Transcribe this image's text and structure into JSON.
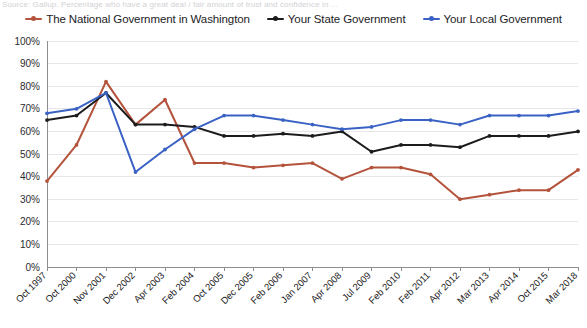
{
  "source_line": "Source: Gallup. Percentage who have a great deal / fair amount of trust and confidence in ...",
  "legend": [
    {
      "label": "The National Government in Washington",
      "color": "#b4533c",
      "name": "legend-item-national"
    },
    {
      "label": "Your State Government",
      "color": "#1c1c1e",
      "name": "legend-item-state"
    },
    {
      "label": "Your Local Government",
      "color": "#3a62c4",
      "name": "legend-item-local"
    }
  ],
  "chart_data": {
    "type": "line",
    "title": "",
    "xlabel": "",
    "ylabel": "",
    "ylim": [
      0,
      100
    ],
    "ytick_step": 10,
    "ytick_labels": [
      "100%",
      "90%",
      "80%",
      "70%",
      "60%",
      "50%",
      "40%",
      "30%",
      "20%",
      "10%",
      "0%"
    ],
    "grid": true,
    "legend_position": "top-center",
    "categories": [
      "Oct 1997",
      "Oct 2000",
      "Nov 2001",
      "Dec 2002",
      "Apr 2003",
      "Feb 2004",
      "Oct 2005",
      "Dec 2005",
      "Feb 2006",
      "Jan 2007",
      "Apr 2008",
      "Jul 2009",
      "Feb 2010",
      "Feb 2011",
      "Apr 2012",
      "Mar 2013",
      "Apr 2014",
      "Oct 2015",
      "Mar 2018"
    ],
    "series": [
      {
        "name": "The National Government in Washington",
        "color": "#b4533c",
        "values": [
          38,
          54,
          82,
          63,
          74,
          46,
          46,
          44,
          45,
          46,
          39,
          44,
          44,
          41,
          30,
          32,
          34,
          34,
          43
        ]
      },
      {
        "name": "Your State Government",
        "color": "#1c1c1e",
        "values": [
          65,
          67,
          77,
          63,
          63,
          62,
          58,
          58,
          59,
          58,
          60,
          51,
          54,
          54,
          53,
          58,
          58,
          58,
          60
        ]
      },
      {
        "name": "Your Local Government",
        "color": "#3a62c4",
        "values": [
          68,
          70,
          77,
          42,
          52,
          61,
          67,
          67,
          65,
          63,
          61,
          62,
          65,
          65,
          63,
          67,
          67,
          67,
          69
        ]
      }
    ]
  }
}
